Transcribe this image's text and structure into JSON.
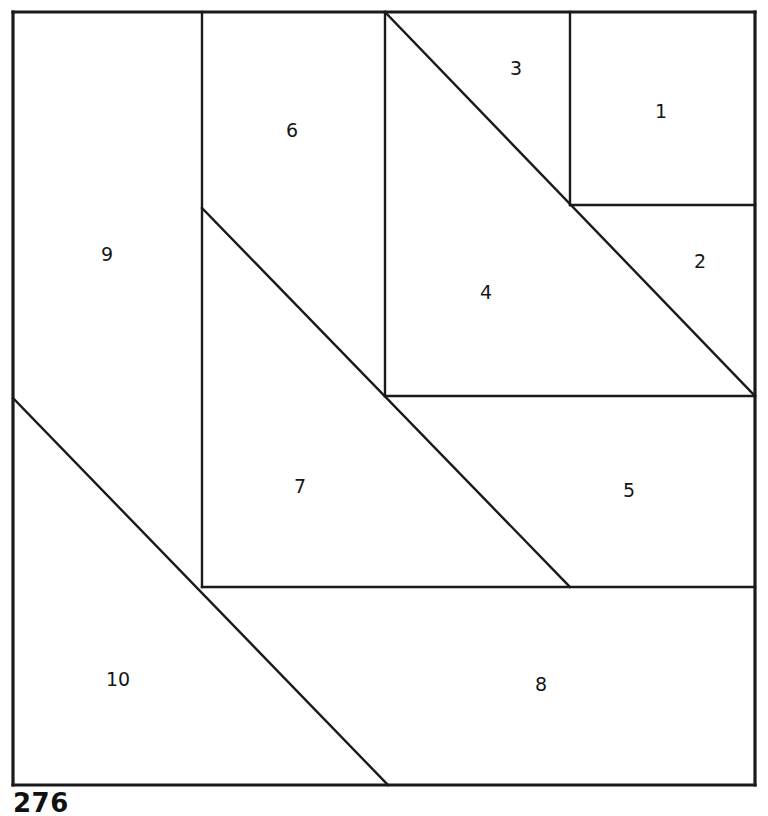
{
  "figure": {
    "kind": "squared-square-dissection",
    "background_color": "#ffffff",
    "line_color": "#1a1a1a",
    "label_color": "#161616",
    "canvas": {
      "width": 768,
      "height": 808
    },
    "outer_square": {
      "left": 13,
      "top": 12,
      "right": 755,
      "bottom": 785
    },
    "regions": [
      {
        "id": "region-1",
        "label": "1",
        "shape": "square",
        "label_x": 661,
        "label_y": 112
      },
      {
        "id": "region-2",
        "label": "2",
        "shape": "triangle",
        "label_x": 700,
        "label_y": 262
      },
      {
        "id": "region-3",
        "label": "3",
        "shape": "triangle",
        "label_x": 516,
        "label_y": 69
      },
      {
        "id": "region-4",
        "label": "4",
        "shape": "triangle",
        "label_x": 486,
        "label_y": 293
      },
      {
        "id": "region-5",
        "label": "5",
        "shape": "trapezoid",
        "label_x": 629,
        "label_y": 491
      },
      {
        "id": "region-6",
        "label": "6",
        "shape": "quadrilateral",
        "label_x": 292,
        "label_y": 131
      },
      {
        "id": "region-7",
        "label": "7",
        "shape": "triangle",
        "label_x": 300,
        "label_y": 487
      },
      {
        "id": "region-8",
        "label": "8",
        "shape": "quadrilateral",
        "label_x": 541,
        "label_y": 685
      },
      {
        "id": "region-9",
        "label": "9",
        "shape": "quadrilateral",
        "label_x": 107,
        "label_y": 255
      },
      {
        "id": "region-10",
        "label": "10",
        "shape": "triangle",
        "label_x": 118,
        "label_y": 680
      }
    ],
    "edges": [
      {
        "name": "outer-top",
        "x1": 13,
        "y1": 12,
        "x2": 755,
        "y2": 12,
        "kind": "outer"
      },
      {
        "name": "outer-right",
        "x1": 755,
        "y1": 12,
        "x2": 755,
        "y2": 785,
        "kind": "outer"
      },
      {
        "name": "outer-bottom",
        "x1": 755,
        "y1": 785,
        "x2": 13,
        "y2": 785,
        "kind": "outer"
      },
      {
        "name": "outer-left",
        "x1": 13,
        "y1": 785,
        "x2": 13,
        "y2": 12,
        "kind": "outer"
      },
      {
        "name": "vertical-x202",
        "x1": 202,
        "y1": 12,
        "x2": 202,
        "y2": 587,
        "kind": "inner"
      },
      {
        "name": "vertical-x385",
        "x1": 385,
        "y1": 12,
        "x2": 385,
        "y2": 396,
        "kind": "inner"
      },
      {
        "name": "vertical-x570",
        "x1": 570,
        "y1": 12,
        "x2": 570,
        "y2": 205,
        "kind": "inner"
      },
      {
        "name": "horizontal-y205",
        "x1": 570,
        "y1": 205,
        "x2": 755,
        "y2": 205,
        "kind": "inner"
      },
      {
        "name": "horizontal-y396",
        "x1": 385,
        "y1": 396,
        "x2": 755,
        "y2": 396,
        "kind": "inner"
      },
      {
        "name": "horizontal-y587",
        "x1": 202,
        "y1": 587,
        "x2": 755,
        "y2": 587,
        "kind": "inner"
      },
      {
        "name": "diagonal-upper-right",
        "x1": 385,
        "y1": 12,
        "x2": 755,
        "y2": 396,
        "kind": "inner"
      },
      {
        "name": "diagonal-middle",
        "x1": 202,
        "y1": 208,
        "x2": 570,
        "y2": 587,
        "kind": "inner"
      },
      {
        "name": "diagonal-lower-left",
        "x1": 13,
        "y1": 398,
        "x2": 388,
        "y2": 785,
        "kind": "inner"
      }
    ]
  },
  "caption": {
    "text": "276"
  }
}
